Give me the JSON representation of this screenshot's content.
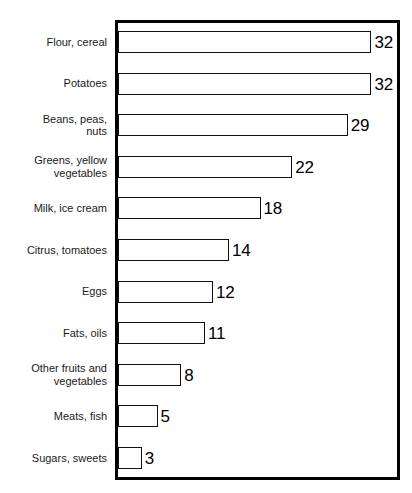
{
  "chart": {
    "title": "",
    "frame": {
      "border_color": "#000000",
      "background": "#ffffff"
    }
  },
  "chart_data": {
    "type": "bar",
    "orientation": "horizontal",
    "title": "",
    "subtitle": "",
    "xlabel": "",
    "ylabel": "",
    "xlim": [
      0,
      36
    ],
    "grid": false,
    "legend": false,
    "bar_fill_color": "#ffffff",
    "bar_edge_color": "#111111",
    "categories": [
      "Flour, cereal",
      "Potatoes",
      "Beans, peas,\nnuts",
      "Greens, yellow\nvegetables",
      "Milk, ice cream",
      "Citrus, tomatoes",
      "Eggs",
      "Fats, oils",
      "Other fruits and\nvegetables",
      "Meats, fish",
      "Sugars, sweets"
    ],
    "values": [
      32,
      32,
      29,
      22,
      18,
      14,
      12,
      11,
      8,
      5,
      3
    ],
    "value_labels": [
      "32",
      "32",
      "29",
      "22",
      "18",
      "14",
      "12",
      "11",
      "8",
      "5",
      "3"
    ]
  }
}
